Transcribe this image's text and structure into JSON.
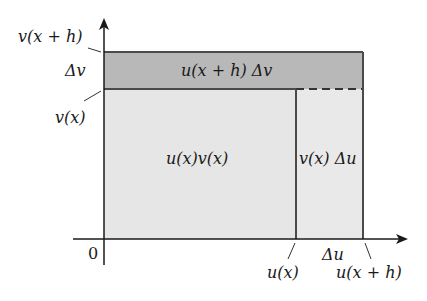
{
  "figure": {
    "type": "product-rule-area-diagram",
    "colors": {
      "background": "#ffffff",
      "light_region": "#e6e6e6",
      "dark_band": "#b8b8b8",
      "stroke": "#4a4a4a",
      "axis": "#1a1a1a"
    },
    "y_axis_labels": {
      "top": "v(x + h)",
      "delta": "Δv",
      "bottom": "v(x)"
    },
    "x_axis_labels": {
      "origin": "0",
      "left": "u(x)",
      "delta": "Δu",
      "right": "u(x + h)"
    },
    "region_labels": {
      "main": "u(x)v(x)",
      "top_band": "u(x + h) Δv",
      "right_strip": "v(x) Δu"
    }
  }
}
